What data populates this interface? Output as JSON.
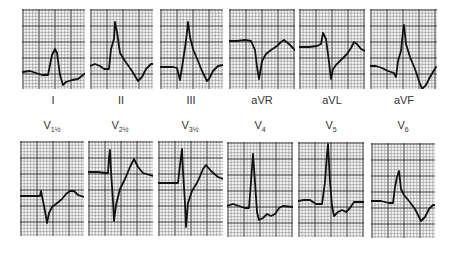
{
  "figure": {
    "colors": {
      "grid_minor": "#777777",
      "grid_major": "#222222",
      "trace": "#111111",
      "paper": "#f4f4f4"
    }
  },
  "limb_leads": [
    {
      "label": "I",
      "x": 22,
      "y": 9,
      "w": 63,
      "h": 80,
      "trace": "0,63 8,62 14,64 20,66 26,66 30,46 33,40 35,44 38,66 41,76 44,73 50,71 56,70 61,66 64,64 70,65 76,66"
    },
    {
      "label": "II",
      "x": 90,
      "y": 9,
      "w": 63,
      "h": 80,
      "trace": "0,57 5,55 10,57 14,60 19,60 21,40 24,30 25,13 27,23 30,44 35,52 42,62 48,72 52,68 56,60 61,55 64,55"
    },
    {
      "label": "III",
      "x": 160,
      "y": 9,
      "w": 63,
      "h": 80,
      "trace": "0,58 8,58 13,58 17,59 20,71 23,52 26,32 28,13 30,28 33,40 38,52 42,62 47,72 49,70 53,62 58,57 63,56"
    },
    {
      "label": "aVR",
      "x": 229,
      "y": 9,
      "w": 66,
      "h": 80,
      "trace": "0,32 8,32 16,31 22,32 26,41 28,58 30,70 33,52 37,45 42,41 48,37 52,33 55,31 60,35 66,41"
    },
    {
      "label": "aVL",
      "x": 299,
      "y": 9,
      "w": 66,
      "h": 80,
      "trace": "0,38 10,38 18,37 22,35 24,24 27,30 29,45 32,70 34,60 37,56 42,51 48,45 52,39 55,33 58,35 62,40 66,42"
    },
    {
      "label": "aVF",
      "x": 370,
      "y": 9,
      "w": 67,
      "h": 80,
      "trace": "0,57 6,57 12,59 18,62 24,64 26,68 28,52 31,42 33,22 34,16 36,35 40,48 45,60 49,72 52,80 56,76 60,68 66,58"
    }
  ],
  "precordial_leads": [
    {
      "label": "V",
      "sub": "1½",
      "x": 20,
      "y": 141,
      "w": 64,
      "h": 95,
      "trace": "0,55 10,55 17,55 20,55 21,50 23,60 25,70 27,82 29,72 32,66 36,63 42,58 46,53 50,50 54,50 58,54 64,56"
    },
    {
      "label": "V",
      "sub": "2½",
      "x": 88,
      "y": 141,
      "w": 65,
      "h": 95,
      "trace": "0,31 10,31 17,32 20,32 21,17 22,9 23,30 25,60 26,80 28,64 32,48 37,38 42,26 46,18 50,26 55,32 65,35"
    },
    {
      "label": "V",
      "sub": "3½",
      "x": 158,
      "y": 141,
      "w": 65,
      "h": 95,
      "trace": "0,42 10,42 16,42 20,42 22,24 24,8 25,30 27,62 28,86 30,62 34,50 40,40 45,28 48,24 53,30 60,36 65,38"
    },
    {
      "label": "V",
      "sub": "4",
      "x": 227,
      "y": 142,
      "w": 66,
      "h": 95,
      "trace": "0,64 6,62 12,64 18,66 22,66 24,40 26,12 28,40 30,70 32,78 36,76 40,72 44,74 48,72 52,66 56,64 66,65"
    },
    {
      "label": "V",
      "sub": "5",
      "x": 298,
      "y": 142,
      "w": 66,
      "h": 95,
      "trace": "0,59 6,58 12,58 18,62 24,62 27,40 29,12 30,2 32,40 34,64 36,74 40,70 44,68 48,70 52,66 56,60 62,60 66,60"
    },
    {
      "label": "V",
      "sub": "6",
      "x": 371,
      "y": 143,
      "w": 64,
      "h": 95,
      "trace": "0,58 10,58 18,60 22,60 24,44 26,34 28,28 30,46 33,52 38,58 44,66 48,74 50,78 54,74 58,66 62,62 64,62"
    }
  ]
}
